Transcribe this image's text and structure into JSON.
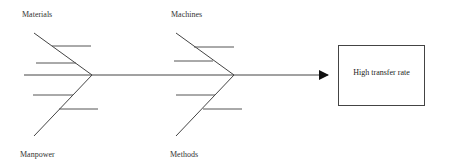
{
  "diagram": {
    "type": "fishbone",
    "effect": "High transfer rate",
    "categories": {
      "top_left": "Materials",
      "top_right": "Machines",
      "bottom_left": "Manpower",
      "bottom_right": "Methods"
    },
    "line_color": "#444444"
  }
}
